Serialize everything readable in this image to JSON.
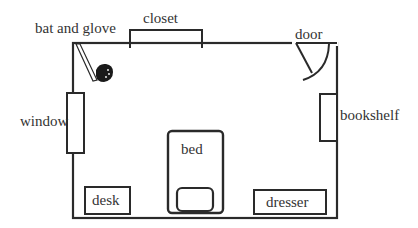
{
  "labels": {
    "bat_and_glove": "bat and glove",
    "closet": "closet",
    "door": "door",
    "window": "window",
    "bookshelf": "bookshelf",
    "bed": "bed",
    "desk": "desk",
    "dresser": "dresser"
  },
  "colors": {
    "stroke": "#2a2a2a",
    "background": "#ffffff"
  }
}
